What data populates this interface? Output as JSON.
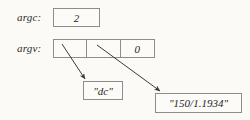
{
  "diagram": {
    "background_color": "#fbfaf7",
    "border_color": "#8d8d8d",
    "text_color": "#1f1f1f",
    "rows": {
      "argc": {
        "label": "argc:",
        "value": "2"
      },
      "argv": {
        "label": "argv:",
        "cells": [
          {
            "value": ""
          },
          {
            "value": ""
          },
          {
            "value": "0"
          }
        ]
      }
    },
    "strings": {
      "first": "\"dc\"",
      "second": "\"150/1.1934\""
    },
    "arrows": [
      {
        "name": "argv-0-to-dc",
        "from": "argv cell 0",
        "to": "\"dc\" box"
      },
      {
        "name": "argv-1-to-number",
        "from": "argv cell 1",
        "to": "\"150/1.1934\" box"
      }
    ]
  }
}
